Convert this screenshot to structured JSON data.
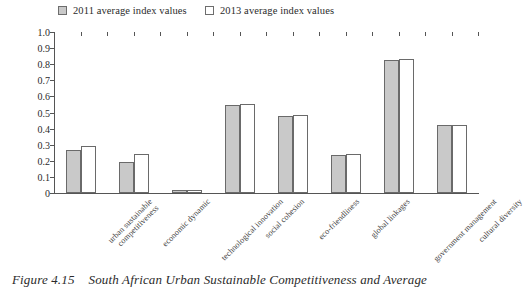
{
  "legend": {
    "items": [
      {
        "label": "2011 average index values",
        "swatch": "#c9c9c9",
        "key": "2011"
      },
      {
        "label": "2013 average index values",
        "swatch": "#ffffff",
        "key": "2013"
      }
    ]
  },
  "caption": {
    "number": "Figure 4.15",
    "text": "South African Urban Sustainable Competitiveness and Average"
  },
  "colors": {
    "series_2011_fill": "#c9c9c9",
    "series_2013_fill": "#ffffff",
    "bar_stroke": "#6a6a6a",
    "axis": "#555555",
    "text": "#2b2b2b"
  },
  "chart_data": {
    "type": "bar",
    "title": "",
    "xlabel": "",
    "ylabel": "",
    "ylim": [
      0,
      1.0
    ],
    "ytick_labels": [
      "1.0",
      "0.9",
      "0.8",
      "0.7",
      "0.6",
      "0.5",
      "0.4",
      "0.3",
      "0.2",
      "0.1",
      "0"
    ],
    "yticks": [
      1.0,
      0.9,
      0.8,
      0.7,
      0.6,
      0.5,
      0.4,
      0.3,
      0.2,
      0.1,
      0
    ],
    "grid": false,
    "legend_position": "top",
    "categories": [
      "urban sustainable competitiveness",
      "economic dynamic",
      "technological innovation",
      "social cohesion",
      "eco-friendliness",
      "global linkages",
      "government management",
      "cultural diversity"
    ],
    "category_lines": [
      [
        "urban sustainable",
        "competitiveness"
      ],
      [
        "economic dynamic",
        ""
      ],
      [
        "technological innovation",
        ""
      ],
      [
        "social cohesion",
        ""
      ],
      [
        "eco-friendliness",
        ""
      ],
      [
        "global linkages",
        ""
      ],
      [
        "government management",
        ""
      ],
      [
        "cultural diversity",
        ""
      ]
    ],
    "series": [
      {
        "name": "2011 average index values",
        "values": [
          0.27,
          0.195,
          0.02,
          0.545,
          0.48,
          0.235,
          0.825,
          0.42
        ]
      },
      {
        "name": "2013 average index values",
        "values": [
          0.29,
          0.245,
          0.02,
          0.55,
          0.485,
          0.24,
          0.83,
          0.425
        ]
      }
    ]
  }
}
